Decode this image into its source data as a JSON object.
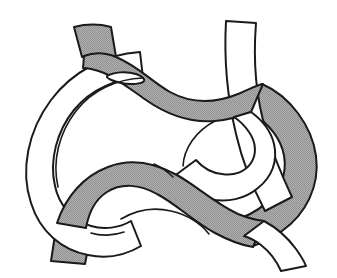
{
  "figure": {
    "background_color": "#ffffff",
    "outline_color": "#1a1a1a",
    "shaded_face_color": "#a8a8a8",
    "unshaded_face_color": "#ffffff",
    "canvas": {
      "width": 337,
      "height": 278
    },
    "strand_ends": [
      {
        "name": "top-left-end",
        "face": "shaded",
        "x": 75,
        "y": 26
      },
      {
        "name": "top-right-end",
        "face": "unshaded",
        "x": 290,
        "y": 23
      },
      {
        "name": "bottom-left-end",
        "face": "shaded",
        "x": 56,
        "y": 262
      },
      {
        "name": "bottom-right-end",
        "face": "unshaded",
        "x": 300,
        "y": 263
      }
    ],
    "crossings": [
      {
        "name": "crossing-upper-left",
        "x": 112,
        "y": 86
      },
      {
        "name": "crossing-upper-right",
        "x": 236,
        "y": 104
      },
      {
        "name": "crossing-lower-left",
        "x": 96,
        "y": 206
      },
      {
        "name": "crossing-lower-right",
        "x": 247,
        "y": 196
      },
      {
        "name": "crossing-center",
        "x": 185,
        "y": 186
      }
    ],
    "twist_eyelet": {
      "name": "ribbon-twist-eyelet",
      "x": 126,
      "y": 79
    }
  }
}
